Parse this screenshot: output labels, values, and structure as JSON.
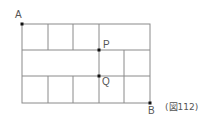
{
  "figure": {
    "caption": "(図112)",
    "labels": {
      "A": "A",
      "B": "B",
      "P": "P",
      "Q": "Q"
    },
    "grid": {
      "columns": 5,
      "rows": 3,
      "x": [
        22,
        48,
        73,
        99,
        124,
        150
      ],
      "y": [
        24,
        50,
        76,
        103
      ],
      "description": "Street grid from A (top-left) to B (bottom-right). Top row: cells 1-3 individual, cells 4-5 merged. Middle row: cells 1-3 merged, cells 4 and 5 individual. Bottom row: 5 individual cells. P is at the intersection of column line 4 and row line 2; Q at column line 4 and row line 3."
    },
    "line_color": "#888888",
    "point_color": "#111111"
  }
}
